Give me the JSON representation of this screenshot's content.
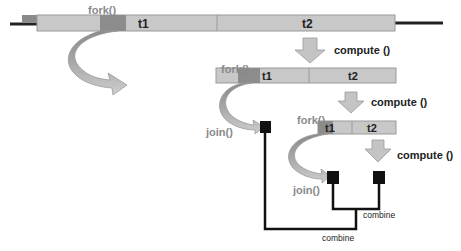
{
  "diagram": {
    "level1": {
      "fork_label": "fork()",
      "t1_label": "t1",
      "t2_label": "t2",
      "compute_label": "compute ()"
    },
    "level2": {
      "fork_label": "fork()",
      "t1_label": "t1",
      "t2_label": "t2",
      "compute_label": "compute ()",
      "join_label": "join()"
    },
    "level3": {
      "fork_label": "fork()",
      "t1_label": "t1",
      "t2_label": "t2",
      "compute_label": "compute ()",
      "join_label": "join()"
    },
    "combine_inner_label": "combine",
    "combine_outer_label": "combine",
    "colors": {
      "bar_fill": "#c8c8c8",
      "bar_stroke": "#9a9a9a",
      "fork_segment": "#8c8c8c",
      "arrow_fill": "#c4c4c4",
      "line": "#111111",
      "fork_text": "#8a8a8a",
      "text": "#222222"
    }
  }
}
